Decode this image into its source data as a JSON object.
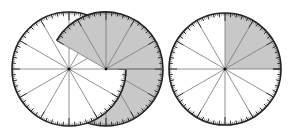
{
  "figure": {
    "colors": {
      "shade": "#c8c8c8",
      "line": "#777777",
      "rim": "#222222",
      "background": "#ffffff"
    },
    "spoke_step_deg": 30,
    "minor_tick_step_deg": 6,
    "circles": [
      {
        "name": "left-white-circle",
        "cx": 69,
        "cy": 69,
        "r": 57,
        "shaded_from_deg": null,
        "shaded_to_deg": null
      },
      {
        "name": "overlapping-shaded-circle",
        "cx": 106,
        "cy": 69,
        "r": 57,
        "shaded_from_deg": 180,
        "shaded_to_deg": 510,
        "note": "shaded all around except wedge 150-180 deg"
      },
      {
        "name": "right-quarter-circle",
        "cx": 225,
        "cy": 69,
        "r": 56,
        "shaded_from_deg": 0,
        "shaded_to_deg": 90
      }
    ]
  }
}
